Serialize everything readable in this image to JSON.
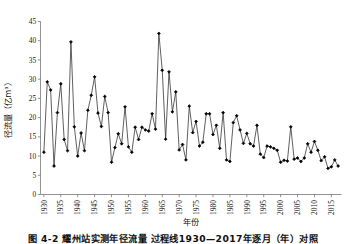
{
  "figure": {
    "caption": "图 4-2   耀州站实测年径流量  过程线1930—2017年逐月（年）对照",
    "axis_titles": {
      "y": "径流量（亿m³）",
      "x": "年份"
    }
  },
  "chart_data": {
    "type": "line",
    "title": "",
    "xlabel": "年份",
    "ylabel": "径流量（亿m³）",
    "xlim": [
      1929,
      2018
    ],
    "ylim": [
      0,
      45
    ],
    "ytick_step": 5,
    "xtick_step": 5,
    "grid": false,
    "legend": null,
    "marker": "filled-diamond",
    "line_color": "#2b2b2b",
    "marker_color": "#000000",
    "yticks": [
      0,
      5,
      10,
      15,
      20,
      25,
      30,
      35,
      40,
      45
    ],
    "xticks": [
      1930,
      1935,
      1940,
      1945,
      1950,
      1955,
      1960,
      1965,
      1970,
      1975,
      1980,
      1985,
      1990,
      1995,
      2000,
      2005,
      2010,
      2015
    ],
    "x": [
      1930,
      1931,
      1932,
      1933,
      1934,
      1935,
      1936,
      1937,
      1938,
      1939,
      1940,
      1941,
      1942,
      1943,
      1944,
      1945,
      1946,
      1947,
      1948,
      1949,
      1950,
      1951,
      1952,
      1953,
      1954,
      1955,
      1956,
      1957,
      1958,
      1959,
      1960,
      1961,
      1962,
      1963,
      1964,
      1965,
      1966,
      1967,
      1968,
      1969,
      1970,
      1971,
      1972,
      1973,
      1974,
      1975,
      1976,
      1977,
      1978,
      1979,
      1980,
      1981,
      1982,
      1983,
      1984,
      1985,
      1986,
      1987,
      1988,
      1989,
      1990,
      1991,
      1992,
      1993,
      1994,
      1995,
      1996,
      1997,
      1998,
      1999,
      2000,
      2001,
      2002,
      2003,
      2004,
      2005,
      2006,
      2007,
      2008,
      2009,
      2010,
      2011,
      2012,
      2013,
      2014,
      2015,
      2016,
      2017
    ],
    "values": [
      11.0,
      29.3,
      27.2,
      7.4,
      21.3,
      28.8,
      14.3,
      11.4,
      39.7,
      17.6,
      10.0,
      16.0,
      11.4,
      21.9,
      25.8,
      30.6,
      21.2,
      17.7,
      25.5,
      21.3,
      8.4,
      12.2,
      15.8,
      13.2,
      22.8,
      12.4,
      11.0,
      17.5,
      14.3,
      17.5,
      16.8,
      16.5,
      21.0,
      17.0,
      41.9,
      32.3,
      14.4,
      31.9,
      21.5,
      26.7,
      11.6,
      13.0,
      9.0,
      23.0,
      16.1,
      19.0,
      12.6,
      13.6,
      21.0,
      21.0,
      15.6,
      18.0,
      12.0,
      21.3,
      9.0,
      8.6,
      18.7,
      20.5,
      16.8,
      13.3,
      15.9,
      13.2,
      12.6,
      18.0,
      10.5,
      9.6,
      12.6,
      12.4,
      12.0,
      11.5,
      8.4,
      8.9,
      8.7,
      17.6,
      9.2,
      9.5,
      8.6,
      9.5,
      13.2,
      11.0,
      13.8,
      11.5,
      8.8,
      9.8,
      6.8,
      7.2,
      9.0,
      7.4
    ]
  }
}
